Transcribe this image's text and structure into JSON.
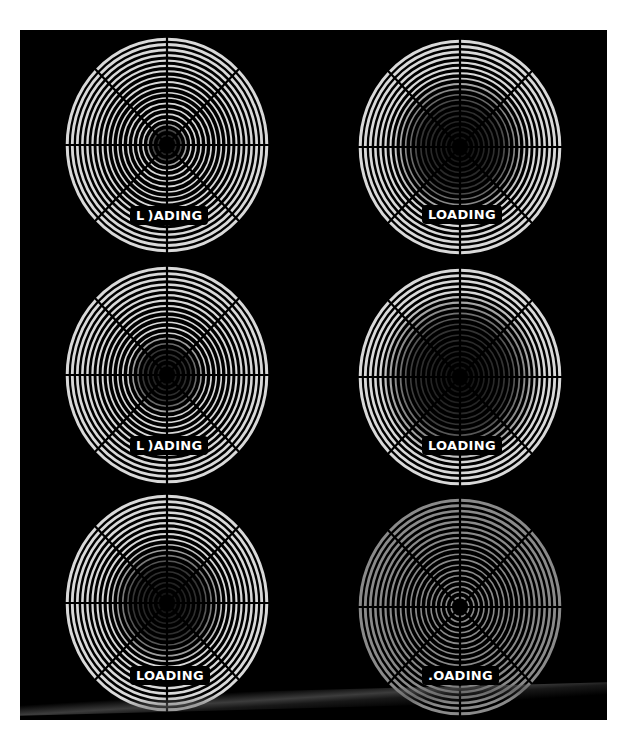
{
  "panel": {
    "background": "#000000",
    "ring_color": "#d9d9d9",
    "dim_ring_color": "#8a8a8a",
    "spoke_color": "#000000"
  },
  "spinners": [
    {
      "id": "frame-1",
      "position": "top-left",
      "cx": 147,
      "cy": 115,
      "rx": 101,
      "ry": 107,
      "dark_radius": 22,
      "ring_opacity": 1.0,
      "label": "L )ADING",
      "label_x": 110,
      "label_y": 176
    },
    {
      "id": "frame-2",
      "position": "top-right",
      "cx": 440,
      "cy": 117,
      "rx": 101,
      "ry": 107,
      "dark_radius": 68,
      "ring_opacity": 1.0,
      "label": "LOADING",
      "label_x": 402,
      "label_y": 175
    },
    {
      "id": "frame-3",
      "position": "middle-left",
      "cx": 147,
      "cy": 345,
      "rx": 101,
      "ry": 108,
      "dark_radius": 40,
      "ring_opacity": 1.0,
      "label": "L )ADING",
      "label_x": 110,
      "label_y": 406
    },
    {
      "id": "frame-4",
      "position": "middle-right",
      "cx": 440,
      "cy": 347,
      "rx": 101,
      "ry": 108,
      "dark_radius": 80,
      "ring_opacity": 1.0,
      "label": "LOADING",
      "label_x": 402,
      "label_y": 406
    },
    {
      "id": "frame-5",
      "position": "bottom-left",
      "cx": 147,
      "cy": 573,
      "rx": 101,
      "ry": 108,
      "dark_radius": 58,
      "ring_opacity": 1.0,
      "label": "LOADING",
      "label_x": 110,
      "label_y": 636
    },
    {
      "id": "frame-6",
      "position": "bottom-right",
      "cx": 440,
      "cy": 577,
      "rx": 101,
      "ry": 108,
      "dark_radius": 0,
      "ring_opacity": 0.55,
      "label": ".OADING",
      "label_x": 402,
      "label_y": 636
    }
  ],
  "ring_count": 20,
  "spoke_count": 8
}
